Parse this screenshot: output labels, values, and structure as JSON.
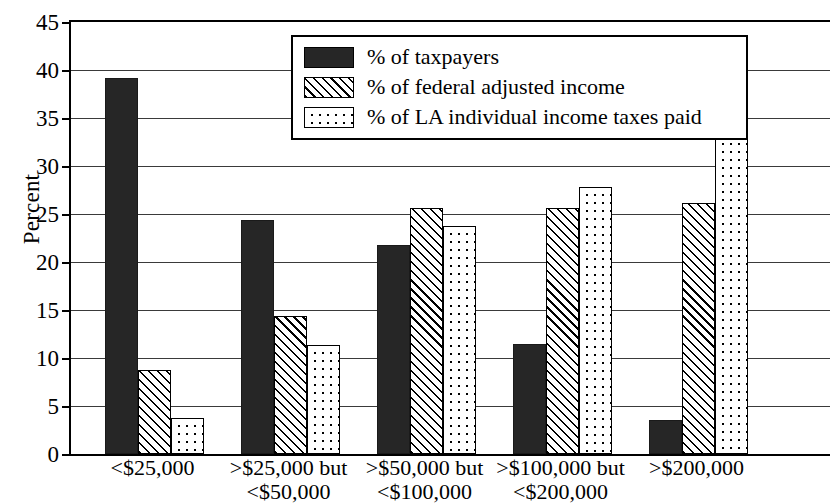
{
  "chart_data": {
    "type": "bar",
    "title": "",
    "xlabel": "",
    "ylabel": "Percent",
    "ylim": [
      0,
      45
    ],
    "yticks": [
      0,
      5,
      10,
      15,
      20,
      25,
      30,
      35,
      40,
      45
    ],
    "grid": true,
    "legend_position": "top-center",
    "categories": [
      "<$25,000",
      ">$25,000 but <$50,000",
      ">$50,000 but <$100,000",
      ">$100,000 but <$200,000",
      ">$200,000"
    ],
    "category_lines": [
      {
        "line1": "<$25,000",
        "line2": ""
      },
      {
        "line1": ">$25,000 but",
        "line2": "<$50,000"
      },
      {
        "line1": ">$50,000 but",
        "line2": "<$100,000"
      },
      {
        "line1": ">$100,000 but",
        "line2": "<$200,000"
      },
      {
        "line1": ">$200,000",
        "line2": ""
      }
    ],
    "series": [
      {
        "name": "% of taxpayers",
        "pattern": "solid",
        "color": "#262626",
        "values": [
          39.2,
          24.4,
          21.8,
          11.5,
          3.5
        ]
      },
      {
        "name": "% of federal adjusted income",
        "pattern": "diagonal-hatch",
        "color": "#ffffff",
        "values": [
          8.8,
          14.4,
          25.6,
          25.6,
          26.1
        ]
      },
      {
        "name": "% of LA individual income taxes paid",
        "pattern": "dots",
        "color": "#ffffff",
        "values": [
          3.8,
          11.4,
          23.7,
          27.8,
          34.0
        ]
      }
    ]
  }
}
